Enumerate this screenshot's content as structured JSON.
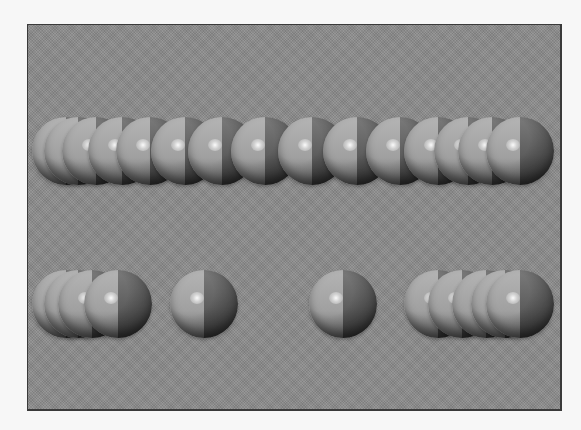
{
  "scene": {
    "description": "Two rows of glossy two-tone spheres on a gray textured backdrop",
    "frame": {
      "x": 27,
      "y": 24,
      "width": 532,
      "height": 384
    },
    "colors": {
      "page_background": "#f7f7f7",
      "frame_background": "#8c8c8c",
      "frame_border": "#3a3a3a",
      "sphere_light_half": "#b4b4b4",
      "sphere_dark_half": "#5e5e5e"
    },
    "sphere_radius": 34,
    "rows": [
      {
        "name": "top-row",
        "center_y": 151,
        "centers_x": [
          66,
          78,
          96,
          122,
          150,
          185,
          222,
          265,
          312,
          357,
          400,
          438,
          468,
          492,
          520
        ]
      },
      {
        "name": "bottom-row",
        "center_y": 304,
        "groups": [
          {
            "name": "left-cluster",
            "centers_x": [
              66,
              78,
              92,
              118
            ]
          },
          {
            "name": "isolated-sphere-1",
            "centers_x": [
              204
            ]
          },
          {
            "name": "isolated-sphere-2",
            "centers_x": [
              343
            ]
          },
          {
            "name": "right-cluster",
            "centers_x": [
              438,
              462,
              486,
              505,
              520
            ]
          }
        ]
      }
    ]
  }
}
